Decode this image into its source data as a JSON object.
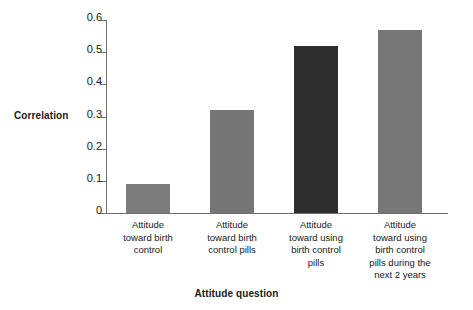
{
  "chart_data": {
    "type": "bar",
    "title": "",
    "xlabel": "Attitude question",
    "ylabel": "Correlation",
    "categories": [
      "Attitude toward birth control",
      "Attitude toward birth control pills",
      "Attitude toward using birth control pills",
      "Attitude toward using birth control pills during the next 2 years"
    ],
    "category_lines": [
      [
        "Attitude",
        "toward birth",
        "control"
      ],
      [
        "Attitude",
        "toward birth",
        "control pills"
      ],
      [
        "Attitude",
        "toward using",
        "birth control",
        "pills"
      ],
      [
        "Attitude",
        "toward using",
        "birth control",
        "pills during the",
        "next 2 years"
      ]
    ],
    "values": [
      0.09,
      0.32,
      0.52,
      0.57
    ],
    "ylim": [
      0,
      0.6
    ],
    "ytick_values": [
      0,
      0.1,
      0.2,
      0.3,
      0.4,
      0.5,
      0.6
    ],
    "ytick_labels": [
      "0",
      "0.1",
      "0.2",
      "0.3",
      "0.4",
      "0.5",
      "0.6"
    ],
    "grid": false,
    "legend": "none",
    "bar_colors": [
      "#7c7c7c",
      "#757575",
      "#2e2e2e",
      "#777777"
    ],
    "axis_color": "#6f6f6f",
    "background": "#ffffff"
  }
}
